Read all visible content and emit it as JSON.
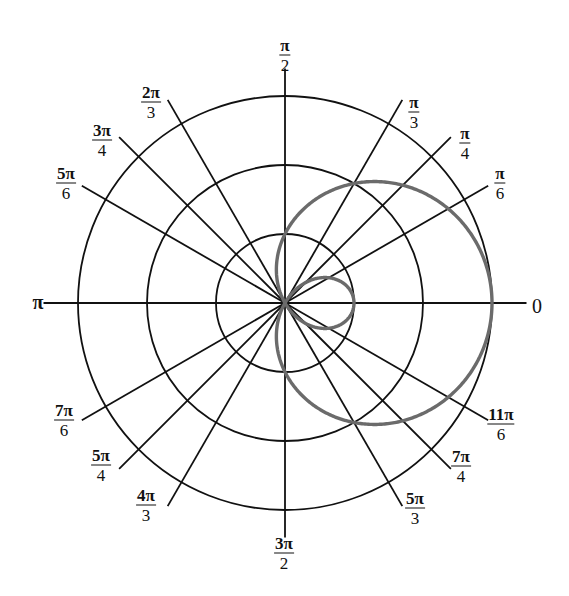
{
  "diagram": {
    "type": "polar_grid",
    "center": [
      285,
      303
    ],
    "unit_px": 69,
    "circle_radii": [
      1,
      2,
      3
    ],
    "spoke_length": 3.4,
    "curve": {
      "equation": "r = 1 + 2cos(theta)",
      "color": "#6b6b6b"
    },
    "grid_color": "#111111"
  },
  "labels": [
    {
      "deg": 0,
      "num": "0",
      "den": "",
      "x": 537,
      "y": 306
    },
    {
      "deg": 30,
      "num": "π",
      "den": "6",
      "x": 500,
      "y": 183
    },
    {
      "deg": 45,
      "num": "π",
      "den": "4",
      "x": 465,
      "y": 143
    },
    {
      "deg": 60,
      "num": "π",
      "den": "3",
      "x": 414,
      "y": 112
    },
    {
      "deg": 90,
      "num": "π",
      "den": "2",
      "x": 285,
      "y": 55
    },
    {
      "deg": 120,
      "num": "2π",
      "den": "3",
      "x": 151,
      "y": 102
    },
    {
      "deg": 135,
      "num": "3π",
      "den": "4",
      "x": 102,
      "y": 140
    },
    {
      "deg": 150,
      "num": "5π",
      "den": "6",
      "x": 66,
      "y": 183
    },
    {
      "deg": 180,
      "num": "π",
      "den": "",
      "x": 38,
      "y": 302
    },
    {
      "deg": 210,
      "num": "7π",
      "den": "6",
      "x": 64,
      "y": 420
    },
    {
      "deg": 225,
      "num": "5π",
      "den": "4",
      "x": 101,
      "y": 465
    },
    {
      "deg": 240,
      "num": "4π",
      "den": "3",
      "x": 146,
      "y": 505
    },
    {
      "deg": 270,
      "num": "3π",
      "den": "2",
      "x": 284,
      "y": 553
    },
    {
      "deg": 300,
      "num": "5π",
      "den": "3",
      "x": 415,
      "y": 508
    },
    {
      "deg": 315,
      "num": "7π",
      "den": "4",
      "x": 461,
      "y": 466
    },
    {
      "deg": 330,
      "num": "11π",
      "den": "6",
      "x": 501,
      "y": 424
    }
  ]
}
